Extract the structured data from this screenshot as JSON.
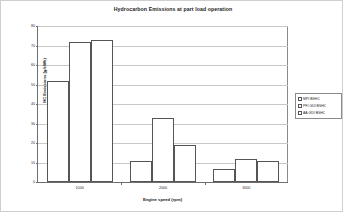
{
  "chart_data": {
    "type": "bar",
    "title": "Hydrocarbon Emissions at part load operation",
    "xlabel": "Engine speed (rpm)",
    "ylabel": "HC Emissions (g/kWh)",
    "categories": [
      "1000",
      "2000",
      "3000"
    ],
    "series": [
      {
        "name": "MPI BSHC",
        "values": [
          52,
          11,
          6.5
        ]
      },
      {
        "name": "PFI GDI BSHC",
        "values": [
          72,
          33,
          12
        ]
      },
      {
        "name": "AA GDI BSHC",
        "values": [
          73,
          19,
          11
        ]
      }
    ],
    "ylim": [
      0,
      80
    ],
    "yticks": [
      0,
      10,
      20,
      30,
      40,
      50,
      60,
      70,
      80
    ],
    "grid": true,
    "legend_position": "right",
    "bar_fill": "#ffffff",
    "bar_edge": "#555555",
    "grid_color": "#c8c8c8",
    "axis_color": "#6e6e6e"
  },
  "legend": {
    "items": [
      {
        "label": "MPI BSHC"
      },
      {
        "label": "PFI GDI BSHC"
      },
      {
        "label": "AA GDI BSHC"
      }
    ]
  }
}
